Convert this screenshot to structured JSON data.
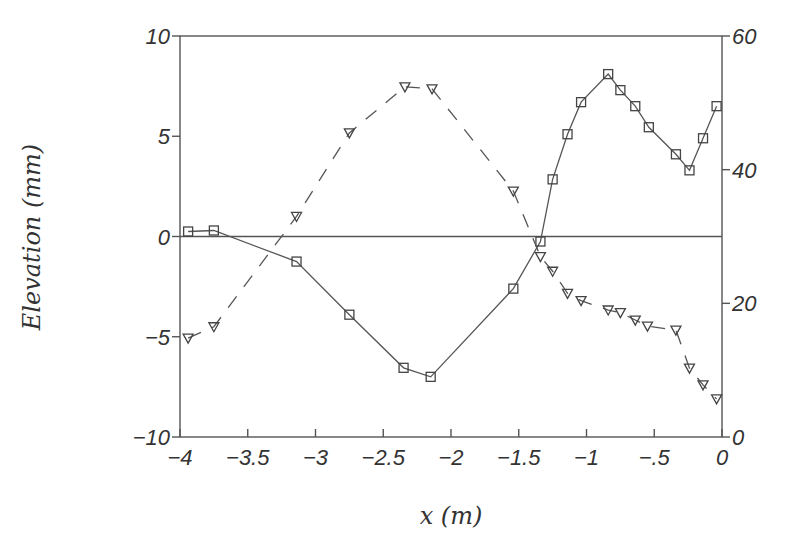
{
  "chart_data": {
    "type": "line",
    "title": "",
    "xlabel": "x (m)",
    "ylabel": "Elevation (mm)",
    "y2label": "",
    "xlim": [
      -4,
      0
    ],
    "ylim": [
      -10,
      10
    ],
    "y2lim": [
      0,
      60
    ],
    "grid": false,
    "legend": null,
    "x_ticks": [
      -4,
      -3.5,
      -3,
      -2.5,
      -2,
      -1.5,
      -1,
      -0.5,
      0
    ],
    "x_tick_labels": [
      "−4",
      "−3.5",
      "−3",
      "−2.5",
      "−2",
      "−1.5",
      "−1",
      "−.5",
      "0"
    ],
    "y_ticks": [
      10,
      5,
      0,
      -5,
      -10
    ],
    "y_tick_labels": [
      "10",
      "5",
      "0",
      "−5",
      "−10"
    ],
    "y2_ticks": [
      60,
      40,
      20,
      0
    ],
    "y2_tick_labels": [
      "60",
      "40",
      "20",
      "0"
    ],
    "reference_lines": [
      {
        "axis": "y",
        "value": 0,
        "style": "solid"
      }
    ],
    "series": [
      {
        "name": "Elevation (squares, solid line)",
        "axis": "left",
        "marker": "square",
        "line_style": "solid",
        "x": [
          -3.94,
          -3.75,
          -3.14,
          -2.75,
          -2.35,
          -2.15,
          -1.54,
          -1.34,
          -1.25,
          -1.14,
          -1.04,
          -0.84,
          -0.75,
          -0.64,
          -0.54,
          -0.34,
          -0.24,
          -0.14,
          -0.04
        ],
        "values": [
          0.25,
          0.3,
          -1.25,
          -3.9,
          -6.55,
          -7.0,
          -2.6,
          -0.25,
          2.85,
          5.1,
          6.7,
          8.1,
          7.3,
          6.5,
          5.45,
          4.1,
          3.3,
          4.9,
          6.5
        ]
      },
      {
        "name": "Right-axis series (triangles, dashed line)",
        "axis": "right",
        "marker": "triangle-down",
        "line_style": "dashed",
        "x": [
          -3.94,
          -3.75,
          -3.14,
          -2.75,
          -2.34,
          -2.14,
          -1.54,
          -1.34,
          -1.25,
          -1.14,
          -1.04,
          -0.84,
          -0.75,
          -0.64,
          -0.55,
          -0.34,
          -0.24,
          -0.14,
          -0.04
        ],
        "values": [
          14.8,
          16.5,
          33.0,
          45.5,
          52.4,
          52.1,
          36.8,
          27.0,
          24.8,
          21.5,
          20.4,
          19.0,
          18.6,
          17.5,
          16.6,
          16.0,
          10.3,
          7.8,
          5.7
        ]
      }
    ]
  },
  "labels": {
    "xlabel": "x (m)",
    "ylabel": "Elevation (mm)"
  }
}
